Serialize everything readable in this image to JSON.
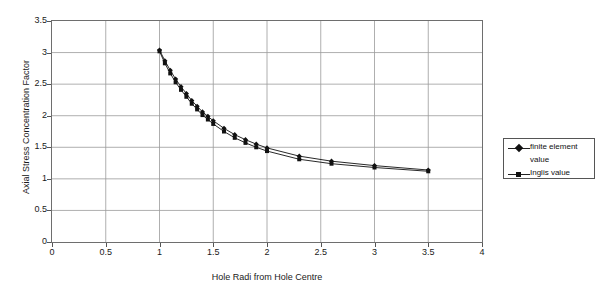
{
  "chart_data": {
    "type": "scatter",
    "title": "",
    "xlabel": "Hole Radi from Hole Centre",
    "ylabel": "Axial Stress Concentration Factor",
    "xlim": [
      0,
      4
    ],
    "ylim": [
      0,
      3.5
    ],
    "xticks": [
      "0",
      "0.5",
      "1",
      "1.5",
      "2",
      "2.5",
      "3",
      "3.5",
      "4"
    ],
    "xtick_values": [
      0,
      0.5,
      1,
      1.5,
      2,
      2.5,
      3,
      3.5,
      4
    ],
    "yticks": [
      "0",
      "0.5",
      "1",
      "1.5",
      "2",
      "2.5",
      "3",
      "3.5"
    ],
    "ytick_values": [
      0,
      0.5,
      1,
      1.5,
      2,
      2.5,
      3,
      3.5
    ],
    "grid": true,
    "legend_position": "right",
    "series": [
      {
        "name": "finite element value",
        "marker": "diamond",
        "color": "#111111",
        "x": [
          1.0,
          1.05,
          1.1,
          1.15,
          1.2,
          1.25,
          1.3,
          1.35,
          1.4,
          1.45,
          1.5,
          1.6,
          1.7,
          1.8,
          1.9,
          2.0,
          2.3,
          2.6,
          3.0,
          3.5
        ],
        "y": [
          3.04,
          2.87,
          2.72,
          2.58,
          2.46,
          2.35,
          2.24,
          2.15,
          2.06,
          1.99,
          1.92,
          1.8,
          1.7,
          1.62,
          1.55,
          1.49,
          1.36,
          1.28,
          1.21,
          1.14
        ]
      },
      {
        "name": "Inglis value",
        "marker": "square",
        "color": "#111111",
        "x": [
          1.0,
          1.05,
          1.1,
          1.15,
          1.2,
          1.25,
          1.3,
          1.35,
          1.4,
          1.45,
          1.5,
          1.6,
          1.7,
          1.8,
          1.9,
          2.0,
          2.3,
          2.6,
          3.0,
          3.5
        ],
        "y": [
          3.02,
          2.83,
          2.67,
          2.53,
          2.41,
          2.3,
          2.19,
          2.1,
          2.01,
          1.94,
          1.87,
          1.75,
          1.65,
          1.57,
          1.5,
          1.44,
          1.31,
          1.24,
          1.18,
          1.12
        ]
      }
    ]
  },
  "legend": {
    "items": [
      {
        "label_line1": "finite element",
        "label_line2": "value"
      },
      {
        "label_line1": "Inglis value",
        "label_line2": ""
      }
    ]
  }
}
